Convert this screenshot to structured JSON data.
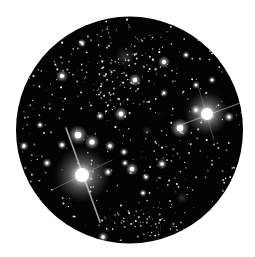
{
  "image": {
    "description": "Star field viewed through a circular telescope eyepiece",
    "background_color": "#ffffff",
    "sky_color": "#030303"
  },
  "aperture": {
    "cx": 129.5,
    "cy": 130,
    "r": 113.5
  },
  "nebula": [
    {
      "x": 125,
      "y": 57,
      "r": 11,
      "opacity": 0.28
    },
    {
      "x": 147,
      "y": 131,
      "r": 5,
      "opacity": 0.25
    },
    {
      "x": 182,
      "y": 198,
      "r": 6,
      "opacity": 0.28
    },
    {
      "x": 205,
      "y": 108,
      "r": 22,
      "opacity": 0.12
    }
  ],
  "bright_stars": [
    {
      "name": "bright-star-lower-left",
      "x": 82,
      "y": 175,
      "core": 7,
      "halo": 28,
      "spikes": [
        {
          "x1": 66,
          "y1": 128,
          "x2": 100,
          "y2": 222,
          "w": 1.6,
          "o": 0.7
        },
        {
          "x1": 52,
          "y1": 190,
          "x2": 112,
          "y2": 160,
          "w": 1.0,
          "o": 0.35
        }
      ]
    },
    {
      "name": "bright-star-right",
      "x": 207,
      "y": 114,
      "core": 6,
      "halo": 22,
      "spikes": [
        {
          "x1": 178,
          "y1": 126,
          "x2": 240,
          "y2": 103,
          "w": 1.1,
          "o": 0.5
        },
        {
          "x1": 198,
          "y1": 86,
          "x2": 214,
          "y2": 140,
          "w": 0.8,
          "o": 0.3
        }
      ]
    }
  ],
  "medium_stars": [
    {
      "x": 78,
      "y": 135,
      "r": 4.5
    },
    {
      "x": 92,
      "y": 142,
      "r": 3.5
    },
    {
      "x": 180,
      "y": 128,
      "r": 4.5
    },
    {
      "x": 121,
      "y": 114,
      "r": 3.2
    },
    {
      "x": 135,
      "y": 80,
      "r": 3
    },
    {
      "x": 164,
      "y": 62,
      "r": 2.8
    },
    {
      "x": 62,
      "y": 76,
      "r": 2.8
    },
    {
      "x": 196,
      "y": 110,
      "r": 2.6
    },
    {
      "x": 229,
      "y": 117,
      "r": 2.4
    },
    {
      "x": 132,
      "y": 169,
      "r": 3
    },
    {
      "x": 162,
      "y": 164,
      "r": 2.4
    },
    {
      "x": 110,
      "y": 146,
      "r": 2.4
    },
    {
      "x": 24,
      "y": 146,
      "r": 2.2
    },
    {
      "x": 47,
      "y": 163,
      "r": 2.2
    },
    {
      "x": 62,
      "y": 145,
      "r": 2.2
    },
    {
      "x": 103,
      "y": 237,
      "r": 2.4
    },
    {
      "x": 100,
      "y": 116,
      "r": 2
    },
    {
      "x": 146,
      "y": 177,
      "r": 1.8
    },
    {
      "x": 124,
      "y": 152,
      "r": 2
    },
    {
      "x": 196,
      "y": 85,
      "r": 1.8
    },
    {
      "x": 212,
      "y": 80,
      "r": 1.8
    },
    {
      "x": 186,
      "y": 55,
      "r": 1.8
    },
    {
      "x": 82,
      "y": 43,
      "r": 2
    },
    {
      "x": 143,
      "y": 193,
      "r": 1.8
    },
    {
      "x": 40,
      "y": 125,
      "r": 1.8
    },
    {
      "x": 164,
      "y": 93,
      "r": 1.8
    },
    {
      "x": 108,
      "y": 172,
      "r": 2.2
    },
    {
      "x": 125,
      "y": 163,
      "r": 1.8
    }
  ],
  "faint_star_field": {
    "count": 420,
    "seed": 7,
    "min_r": 0.35,
    "max_r": 1.1,
    "cluster_center": {
      "x": 120,
      "y": 70
    },
    "cluster_count": 140,
    "bottom_cluster_center": {
      "x": 140,
      "y": 222
    },
    "bottom_cluster_count": 60
  }
}
